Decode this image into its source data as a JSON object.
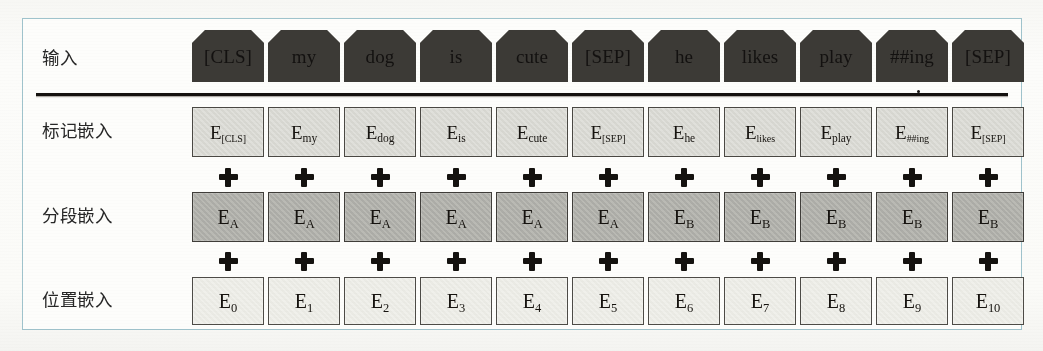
{
  "figure": {
    "frame_border_color": "#9fc3cc",
    "page_background": "#fdfdfb",
    "separator_color": "#15120f"
  },
  "rows": {
    "input": {
      "label": "输入",
      "fill_color": "#b9b9b4",
      "shape": "chamfered-tag"
    },
    "token_embeddings": {
      "label": "标记嵌入",
      "fill_color": "#dcdcd6",
      "shape": "rectangle"
    },
    "segment_embeddings": {
      "label": "分段嵌入",
      "fill_color": "#b2b2ac",
      "shape": "rectangle"
    },
    "position_embeddings": {
      "label": "位置嵌入",
      "fill_color": "#eeeee8",
      "shape": "rectangle"
    }
  },
  "operator": {
    "symbol": "+",
    "name": "plus-sign",
    "color": "#14120f",
    "count_per_row": 11
  },
  "columns": [
    {
      "index": 0,
      "input": "[CLS]",
      "token_e_base": "E",
      "token_e_sub": "[CLS]",
      "segment_e_base": "E",
      "segment_e_sub": "A",
      "position_e_base": "E",
      "position_e_sub": "0"
    },
    {
      "index": 1,
      "input": "my",
      "token_e_base": "E",
      "token_e_sub": "my",
      "segment_e_base": "E",
      "segment_e_sub": "A",
      "position_e_base": "E",
      "position_e_sub": "1"
    },
    {
      "index": 2,
      "input": "dog",
      "token_e_base": "E",
      "token_e_sub": "dog",
      "segment_e_base": "E",
      "segment_e_sub": "A",
      "position_e_base": "E",
      "position_e_sub": "2"
    },
    {
      "index": 3,
      "input": "is",
      "token_e_base": "E",
      "token_e_sub": "is",
      "segment_e_base": "E",
      "segment_e_sub": "A",
      "position_e_base": "E",
      "position_e_sub": "3"
    },
    {
      "index": 4,
      "input": "cute",
      "token_e_base": "E",
      "token_e_sub": "cute",
      "segment_e_base": "E",
      "segment_e_sub": "A",
      "position_e_base": "E",
      "position_e_sub": "4"
    },
    {
      "index": 5,
      "input": "[SEP]",
      "token_e_base": "E",
      "token_e_sub": "[SEP]",
      "segment_e_base": "E",
      "segment_e_sub": "A",
      "position_e_base": "E",
      "position_e_sub": "5"
    },
    {
      "index": 6,
      "input": "he",
      "token_e_base": "E",
      "token_e_sub": "he",
      "segment_e_base": "E",
      "segment_e_sub": "B",
      "position_e_base": "E",
      "position_e_sub": "6"
    },
    {
      "index": 7,
      "input": "likes",
      "token_e_base": "E",
      "token_e_sub": "likes",
      "segment_e_base": "E",
      "segment_e_sub": "B",
      "position_e_base": "E",
      "position_e_sub": "7"
    },
    {
      "index": 8,
      "input": "play",
      "token_e_base": "E",
      "token_e_sub": "play",
      "segment_e_base": "E",
      "segment_e_sub": "B",
      "position_e_base": "E",
      "position_e_sub": "8"
    },
    {
      "index": 9,
      "input": "##ing",
      "token_e_base": "E",
      "token_e_sub": "##ing",
      "segment_e_base": "E",
      "segment_e_sub": "B",
      "position_e_base": "E",
      "position_e_sub": "9"
    },
    {
      "index": 10,
      "input": "[SEP]",
      "token_e_base": "E",
      "token_e_sub": "[SEP]",
      "segment_e_base": "E",
      "segment_e_sub": "B",
      "position_e_base": "E",
      "position_e_sub": "10"
    }
  ]
}
